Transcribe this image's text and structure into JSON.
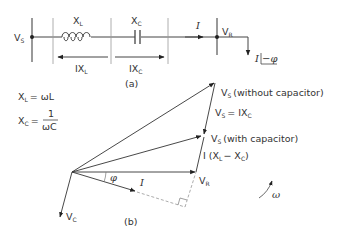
{
  "circuit": {
    "source_label": "V",
    "source_sub": "S",
    "inductor_label": "X",
    "inductor_sub": "L",
    "capacitor_label": "X",
    "capacitor_sub": "C",
    "drop_L_label": "IX",
    "drop_L_sub": "L",
    "drop_C_label": "IX",
    "drop_C_sub": "C",
    "current_label": "I",
    "receiving_label": "V",
    "receiving_sub": "R",
    "load_label": "I",
    "load_angle": "−φ",
    "caption": "(a)"
  },
  "equations": {
    "xl_lhs": "X",
    "xl_sub": "L",
    "xl_rhs": "= ωL",
    "xc_lhs": "X",
    "xc_sub": "C",
    "xc_eq": "=",
    "xc_num": "1",
    "xc_den": "ωC"
  },
  "phasor": {
    "vs_without_label": "V",
    "vs_without_sub": "S",
    "vs_without_text": "(without capacitor)",
    "vs_eq_label": "V",
    "vs_eq_sub": "S",
    "vs_eq_text": "= IX",
    "vs_eq_text_sub": "C",
    "vs_with_label": "V",
    "vs_with_sub": "S",
    "vs_with_text": "(with capacitor)",
    "ixlxc_prefix": "I (X",
    "ixlxc_sub1": "L",
    "ixlxc_mid": "− X",
    "ixlxc_sub2": "C",
    "ixlxc_close": ")",
    "vr_label": "V",
    "vr_sub": "R",
    "phi_label": "φ",
    "i_label": "I",
    "vc_label": "V",
    "vc_sub": "C",
    "omega_label": "ω",
    "caption": "(b)"
  }
}
